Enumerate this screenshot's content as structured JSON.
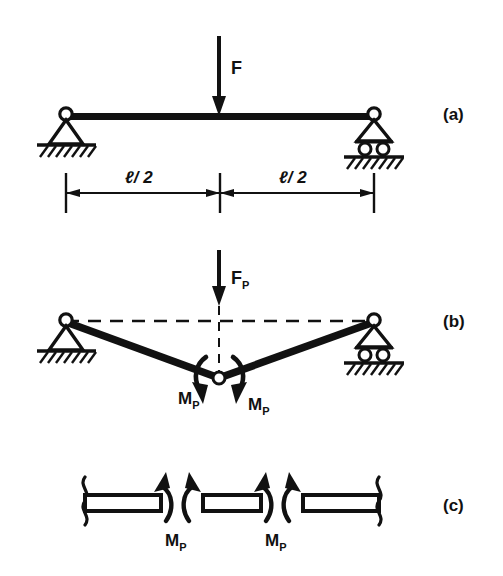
{
  "figure": {
    "background_color": "#ffffff",
    "ink_color": "#111111",
    "width": 503,
    "height": 576
  },
  "panels": [
    {
      "id": "a",
      "letter": "(a)",
      "description": "Elastic simply supported beam with central force F",
      "load_label": "F",
      "dimension_left": "ℓ/ 2",
      "dimension_right": "ℓ/ 2",
      "supports": [
        "pinned-support",
        "roller-support"
      ]
    },
    {
      "id": "b",
      "letter": "(b)",
      "description": "Collapse mechanism with plastic hinge at midspan under limit load F sub P",
      "load_label": "F",
      "load_sub": "P",
      "moment_left_label": "M",
      "moment_left_sub": "P",
      "moment_right_label": "M",
      "moment_right_sub": "P",
      "supports": [
        "pinned-support",
        "roller-support"
      ],
      "undeformed_axis": "dashed"
    },
    {
      "id": "c",
      "letter": "(c)",
      "description": "Free body of beam segments at the plastic hinge with equal and opposite plastic moments",
      "moment_left_label": "M",
      "moment_left_sub": "P",
      "moment_right_label": "M",
      "moment_right_sub": "P",
      "segments": 3
    }
  ],
  "symbols": {
    "ell": "ℓ",
    "half_span": "ℓ/ 2",
    "force": "F",
    "plastic_subscript": "P",
    "moment": "M"
  },
  "icons": {
    "pin_support": "pinned-support-icon",
    "roller_support": "roller-support-icon",
    "hatching": "ground-hatch-icon",
    "down_arrow": "down-arrow-icon",
    "moment_arrow": "curved-moment-arrow-icon",
    "break_symbol": "beam-break-icon"
  }
}
